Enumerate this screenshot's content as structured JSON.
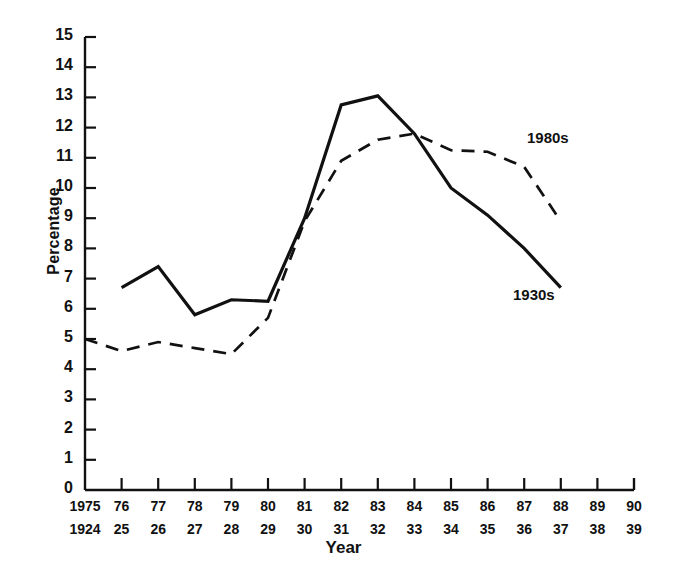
{
  "chart_data": {
    "type": "line",
    "title": "",
    "subtitle": "",
    "xlabel": "Year",
    "ylabel": "Percentage",
    "ylim": [
      0,
      15
    ],
    "ytick_step": 1,
    "grid": false,
    "legend_position": "inline-right",
    "axis_rows": [
      {
        "name": "1980s-years",
        "ticks": [
          "1975",
          "76",
          "77",
          "78",
          "79",
          "80",
          "81",
          "82",
          "83",
          "84",
          "85",
          "86",
          "87",
          "88",
          "89",
          "90"
        ]
      },
      {
        "name": "1930s-years",
        "ticks": [
          "1924",
          "25",
          "26",
          "27",
          "28",
          "29",
          "30",
          "31",
          "32",
          "33",
          "34",
          "35",
          "36",
          "37",
          "38",
          "39"
        ]
      }
    ],
    "ytick_labels": [
      "0",
      "1",
      "2",
      "3",
      "4",
      "5",
      "6",
      "7",
      "8",
      "9",
      "10",
      "11",
      "12",
      "13",
      "14",
      "15"
    ],
    "x_index": [
      0,
      1,
      2,
      3,
      4,
      5,
      6,
      7,
      8,
      9,
      10,
      11,
      12,
      13,
      14,
      15
    ],
    "series": [
      {
        "name": "1930s",
        "style": "solid",
        "color": "#111111",
        "label": "1930s",
        "x": [
          1,
          2,
          3,
          4,
          5,
          6,
          7,
          8,
          9,
          10,
          11,
          12,
          13
        ],
        "values": [
          6.7,
          7.4,
          5.8,
          6.3,
          6.25,
          9.0,
          12.75,
          13.05,
          11.8,
          10.0,
          9.1,
          8.0,
          6.7
        ]
      },
      {
        "name": "1980s",
        "style": "dashed",
        "color": "#111111",
        "label": "1980s",
        "x": [
          0,
          1,
          2,
          3,
          4,
          5,
          6,
          7,
          8,
          9,
          10,
          11,
          12,
          13
        ],
        "values": [
          5.0,
          4.6,
          4.9,
          4.7,
          4.5,
          5.7,
          8.9,
          10.9,
          11.6,
          11.8,
          11.25,
          11.2,
          10.7,
          8.9
        ]
      }
    ],
    "annotations": [
      {
        "name": "label-1980s",
        "text": "1980s",
        "x_px": 527,
        "y_px": 129
      },
      {
        "name": "label-1930s",
        "text": "1930s",
        "x_px": 513,
        "y_px": 286
      }
    ]
  },
  "axis": {
    "y_title": "Percentage",
    "x_title": "Year"
  }
}
